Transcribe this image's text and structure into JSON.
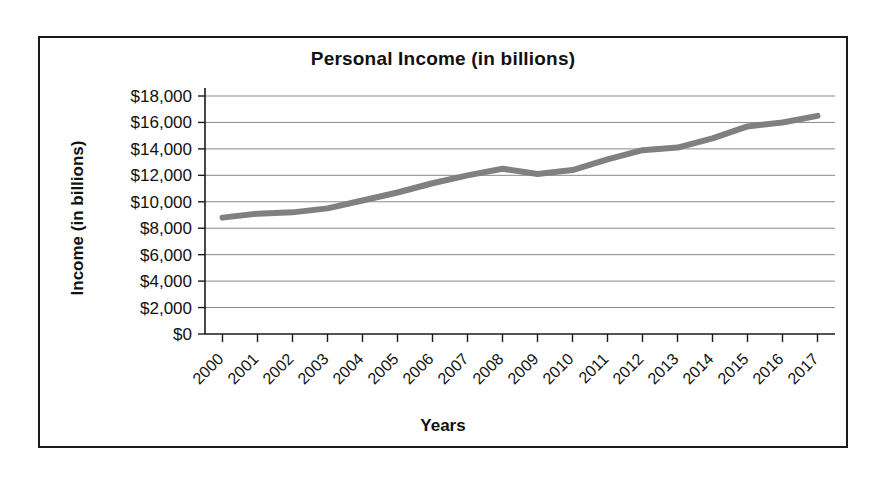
{
  "chart_data": {
    "type": "line",
    "title": "Personal Income (in billions)",
    "xlabel": "Years",
    "ylabel": "Income (in billions)",
    "categories": [
      "2000",
      "2001",
      "2002",
      "2003",
      "2004",
      "2005",
      "2006",
      "2007",
      "2008",
      "2009",
      "2010",
      "2011",
      "2012",
      "2013",
      "2014",
      "2015",
      "2016",
      "2017"
    ],
    "series": [
      {
        "name": "Personal Income",
        "color": "#808080",
        "values": [
          8800,
          9100,
          9200,
          9500,
          10100,
          10700,
          11400,
          12000,
          12500,
          12100,
          12400,
          13200,
          13900,
          14100,
          14800,
          15700,
          16000,
          16500
        ]
      }
    ],
    "ylim": [
      0,
      18000
    ],
    "ytick_values": [
      0,
      2000,
      4000,
      6000,
      8000,
      10000,
      12000,
      14000,
      16000,
      18000
    ],
    "ytick_labels": [
      "$0",
      "$2,000",
      "$4,000",
      "$6,000",
      "$8,000",
      "$10,000",
      "$12,000",
      "$14,000",
      "$16,000",
      "$18,000"
    ],
    "grid": "horizontal",
    "legend": "none",
    "xtick_rotation": -45
  }
}
